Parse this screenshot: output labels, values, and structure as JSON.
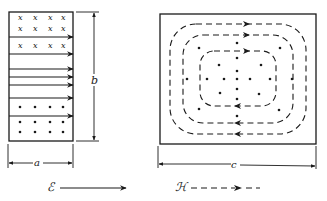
{
  "figure": {
    "left_panel": {
      "description": "Cross-section of waveguide showing electric field lines (solid arrows) and magnetic field markers",
      "dimension_width_label": "a",
      "dimension_height_label": "b",
      "x_marker": "x",
      "dot_marker": "•"
    },
    "right_panel": {
      "description": "Top view showing closed dashed magnetic field loops with dots",
      "dimension_width_label": "c"
    },
    "legend": {
      "electric_symbol": "ℰ",
      "electric_style": "solid arrow",
      "magnetic_symbol": "ℋ",
      "magnetic_style": "dashed arrow"
    },
    "colors": {
      "ink": "#1a1a1a",
      "background": "#ffffff"
    }
  }
}
